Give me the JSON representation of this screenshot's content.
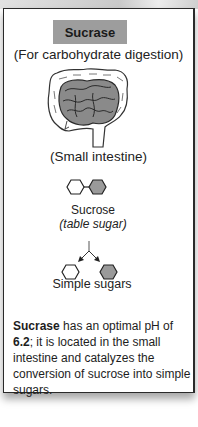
{
  "card": {
    "title": "Sucrase",
    "subtitle": "(For carbohydrate digestion)",
    "organ_label": "(Small intestine)",
    "substrate_label": "Sucrose",
    "substrate_sublabel": "(table sugar)",
    "product_label": "Simple sugars",
    "description": {
      "enzyme": "Sucrase",
      "text_1": " has an optimal pH of ",
      "ph": "6.2",
      "text_2": "; it is located in the small intestine and catalyzes the conversion of sucrose into simple sugars."
    }
  },
  "icons": {
    "organ": "small-intestine-illustration",
    "substrate": "disaccharide-hexagons",
    "reaction": "split-arrow",
    "products": "monosaccharide-hexagons"
  },
  "colors": {
    "title_bg": "#9d9d9d",
    "hex_fill_gray": "#9a9a9a",
    "intestine_fill": "#8a8a8a"
  }
}
